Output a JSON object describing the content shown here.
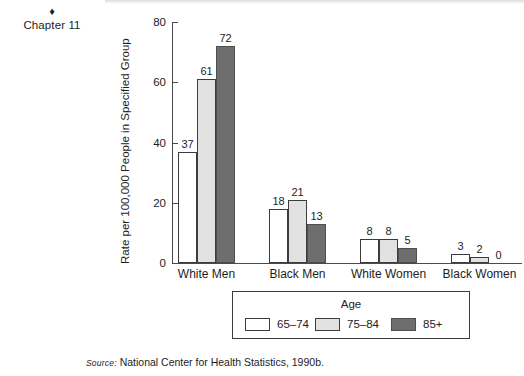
{
  "margin": {
    "diamond_icon": "♦",
    "chapter_label": "Chapter 11"
  },
  "chart_data": {
    "type": "bar",
    "title": "",
    "xlabel": "",
    "ylabel": "Rate per 100,000 People in Specified Group",
    "categories": [
      "White Men",
      "Black Men",
      "White Women",
      "Black Women"
    ],
    "series": [
      {
        "name": "65–74",
        "values": [
          37,
          18,
          8,
          3
        ],
        "color": "#ffffff"
      },
      {
        "name": "75–84",
        "values": [
          61,
          21,
          8,
          2
        ],
        "color": "#e2e2e2"
      },
      {
        "name": "85+",
        "values": [
          72,
          13,
          5,
          0
        ],
        "color": "#6e6e6e"
      }
    ],
    "ylim": [
      0,
      80
    ],
    "yticks": [
      0,
      20,
      40,
      60,
      80
    ],
    "ytick_labels": [
      "0",
      "20",
      "40",
      "60",
      "80"
    ],
    "grid": false,
    "legend_position": "below-center",
    "legend_title": "Age",
    "data_labels": true
  },
  "legend": {
    "title": "Age",
    "entries": [
      "65–74",
      "75–84",
      "85+"
    ]
  },
  "source": {
    "keyword": "Source:",
    "text": "National Center for Health Statistics, 1990b."
  }
}
